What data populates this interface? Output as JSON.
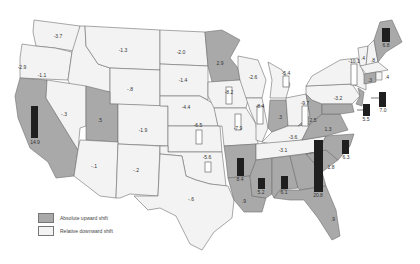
{
  "map": {
    "colors": {
      "upward": "#a9a9a9",
      "downward": "#f3f3f3",
      "border": "#6e6e6e",
      "bar_up": "#1f1f1f",
      "bar_down": "#ffffff"
    },
    "legend": {
      "upward_label": "Absolute upward shift",
      "downward_label": "Relative downward shift"
    },
    "states": [
      {
        "abbr": "WA",
        "value": "-3.7",
        "shift": "down"
      },
      {
        "abbr": "OR",
        "value": "-2.9",
        "shift": "down"
      },
      {
        "abbr": "CA",
        "value": "14.9",
        "shift": "up"
      },
      {
        "abbr": "ID",
        "value": "-1.1",
        "shift": "down"
      },
      {
        "abbr": "NV",
        "value": "-.3",
        "shift": "down"
      },
      {
        "abbr": "MT",
        "value": "-1.3",
        "shift": "down"
      },
      {
        "abbr": "WY",
        "value": "-.8",
        "shift": "down"
      },
      {
        "abbr": "UT",
        "value": ".5",
        "shift": "up"
      },
      {
        "abbr": "CO",
        "value": "-1.9",
        "shift": "down"
      },
      {
        "abbr": "AZ",
        "value": "-.1",
        "shift": "down"
      },
      {
        "abbr": "NM",
        "value": "-.2",
        "shift": "down"
      },
      {
        "abbr": "ND",
        "value": "-2.0",
        "shift": "down"
      },
      {
        "abbr": "SD",
        "value": "-1.4",
        "shift": "down"
      },
      {
        "abbr": "NE",
        "value": "-4.4",
        "shift": "down"
      },
      {
        "abbr": "KS",
        "value": "-6.5",
        "shift": "down"
      },
      {
        "abbr": "OK",
        "value": "-5.6",
        "shift": "down"
      },
      {
        "abbr": "TX",
        "value": "-.6",
        "shift": "down"
      },
      {
        "abbr": "MN",
        "value": "2.9",
        "shift": "up"
      },
      {
        "abbr": "IA",
        "value": "-8.2",
        "shift": "down"
      },
      {
        "abbr": "MO",
        "value": "-7.9",
        "shift": "down"
      },
      {
        "abbr": "AR",
        "value": "8.4",
        "shift": "up"
      },
      {
        "abbr": "LA",
        "value": ".9",
        "shift": "up"
      },
      {
        "abbr": "WI",
        "value": "-2.6",
        "shift": "down"
      },
      {
        "abbr": "IL",
        "value": "-8.4",
        "shift": "down"
      },
      {
        "abbr": "MI",
        "value": "-5.4",
        "shift": "down"
      },
      {
        "abbr": "IN",
        "value": ".3",
        "shift": "up"
      },
      {
        "abbr": "OH",
        "value": "-9.7",
        "shift": "down"
      },
      {
        "abbr": "KY",
        "value": "-3.6",
        "shift": "down"
      },
      {
        "abbr": "TN",
        "value": "-3.1",
        "shift": "down"
      },
      {
        "abbr": "MS",
        "value": "5.2",
        "shift": "up"
      },
      {
        "abbr": "AL",
        "value": "6.1",
        "shift": "up"
      },
      {
        "abbr": "GA",
        "value": "20.8",
        "shift": "up"
      },
      {
        "abbr": "FL",
        "value": ".9",
        "shift": "up"
      },
      {
        "abbr": "SC",
        "value": "1.8",
        "shift": "up"
      },
      {
        "abbr": "NC",
        "value": "6.3",
        "shift": "up"
      },
      {
        "abbr": "VA",
        "value": "1.3",
        "shift": "up"
      },
      {
        "abbr": "WV",
        "value": "2.5",
        "shift": "up"
      },
      {
        "abbr": "PA",
        "value": "-3.2",
        "shift": "down"
      },
      {
        "abbr": "NY",
        "value": "-10.1",
        "shift": "down"
      },
      {
        "abbr": "NJ",
        "value": "7.0",
        "shift": "up"
      },
      {
        "abbr": "MD",
        "value": "5.5",
        "shift": "up"
      },
      {
        "abbr": "VT",
        "value": ".4",
        "shift": "down"
      },
      {
        "abbr": "NH",
        "value": ".8",
        "shift": "down"
      },
      {
        "abbr": "MA",
        "value": ".4",
        "shift": "down"
      },
      {
        "abbr": "CT",
        "value": ".3",
        "shift": "up"
      },
      {
        "abbr": "ME",
        "value": "6.8",
        "shift": "up"
      }
    ]
  }
}
